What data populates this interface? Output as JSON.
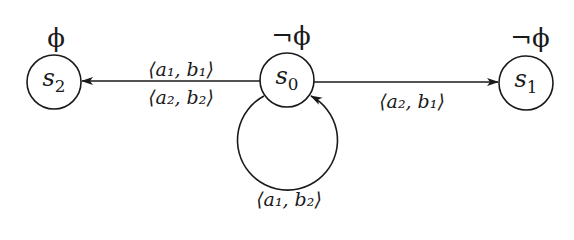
{
  "diagram": {
    "type": "state-transition-graph",
    "nodes": [
      {
        "id": "s2",
        "label": "s",
        "sub": "2",
        "prop": "ϕ",
        "cx": 54,
        "cy": 82
      },
      {
        "id": "s0",
        "label": "s",
        "sub": "0",
        "prop": "¬ϕ",
        "cx": 287,
        "cy": 80
      },
      {
        "id": "s1",
        "label": "s",
        "sub": "1",
        "prop": "¬ϕ",
        "cx": 526,
        "cy": 83
      }
    ],
    "edges": [
      {
        "from": "s0",
        "to": "s2",
        "labels": [
          "⟨a₁, b₁⟩",
          "⟨a₂, b₂⟩"
        ]
      },
      {
        "from": "s0",
        "to": "s1",
        "labels": [
          "⟨a₂, b₁⟩"
        ]
      },
      {
        "from": "s0",
        "to": "s0",
        "labels": [
          "⟨a₁, b₂⟩"
        ]
      }
    ],
    "colors": {
      "stroke": "#1a1a1a",
      "background": "#ffffff"
    }
  },
  "labels": {
    "s2_state": "s",
    "s2_sub": "2",
    "s0_state": "s",
    "s0_sub": "0",
    "s1_state": "s",
    "s1_sub": "1",
    "s2_prop": "ϕ",
    "s0_prop": "¬ϕ",
    "s1_prop": "¬ϕ",
    "edge_s0_s2_top": "⟨a₁, b₁⟩",
    "edge_s0_s2_bottom": "⟨a₂, b₂⟩",
    "edge_s0_s1": "⟨a₂, b₁⟩",
    "edge_s0_loop": "⟨a₁, b₂⟩"
  }
}
